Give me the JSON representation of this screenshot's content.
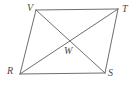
{
  "figure": {
    "background_color": "#ffffff",
    "stroke_color": "#6e6e6e",
    "label_color": "#4a4a4a",
    "stroke_width": 1,
    "width": 137,
    "height": 85
  },
  "labels": {
    "v": "V",
    "t": "T",
    "r": "R",
    "s": "S",
    "w": "W"
  },
  "geometry": {
    "vertices": {
      "V": {
        "x": 36,
        "y": 10
      },
      "T": {
        "x": 118,
        "y": 9
      },
      "S": {
        "x": 105,
        "y": 73
      },
      "R": {
        "x": 20,
        "y": 74
      },
      "W": {
        "x": 68,
        "y": 43
      }
    },
    "edges": [
      {
        "name": "VT",
        "from": "V",
        "to": "T"
      },
      {
        "name": "TS",
        "from": "T",
        "to": "S"
      },
      {
        "name": "SR",
        "from": "S",
        "to": "R"
      },
      {
        "name": "RV",
        "from": "R",
        "to": "V"
      }
    ],
    "diagonals": [
      {
        "name": "VS",
        "from": "V",
        "to": "S"
      },
      {
        "name": "RT",
        "from": "R",
        "to": "T"
      }
    ],
    "label_positions": {
      "V": {
        "x": 27,
        "y": 3
      },
      "T": {
        "x": 122,
        "y": 4
      },
      "R": {
        "x": 7,
        "y": 66
      },
      "S": {
        "x": 108,
        "y": 68
      },
      "W": {
        "x": 64,
        "y": 46
      }
    }
  }
}
